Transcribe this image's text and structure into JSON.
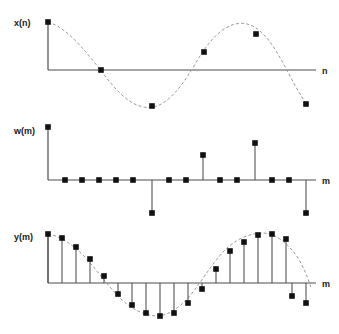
{
  "figure": {
    "title": "",
    "background": "#ffffff",
    "dot_color": "#111111",
    "axis_color": "#4d4d4d",
    "stem_color": "#555555",
    "envelope_color": "#9a9a9a"
  },
  "panels": [
    {
      "id": "panel-xn",
      "ylabel": "x(n)",
      "xlabel": "n",
      "ylabel_pos": {
        "x": 14,
        "y": 22
      },
      "xlabel_pos": {
        "x": 322,
        "y": 74
      },
      "axis": {
        "x0": 48,
        "y0": 70,
        "x1": 316,
        "ytop": 22
      },
      "dots": [
        {
          "x": 48,
          "y": 22
        },
        {
          "x": 101,
          "y": 70
        },
        {
          "x": 152,
          "y": 106
        },
        {
          "x": 204,
          "y": 52
        },
        {
          "x": 256,
          "y": 34
        },
        {
          "x": 306,
          "y": 104
        }
      ],
      "envelope": "M48,22 C62,26 76,40 90,57 C101,70 110,84 122,95 C134,106 146,110 157,106 C170,101 182,86 194,66 C206,45 218,30 232,25 C246,20 258,26 270,42 C282,58 292,82 302,97 C306,103 306,104 306,104"
    },
    {
      "id": "panel-wm",
      "ylabel": "w(m)",
      "xlabel": "m",
      "ylabel_pos": {
        "x": 14,
        "y": 130
      },
      "xlabel_pos": {
        "x": 322,
        "y": 184
      },
      "axis": {
        "x0": 48,
        "y0": 180,
        "x1": 316,
        "ytop": 127
      },
      "baseline_samples": [
        65,
        82,
        99,
        116,
        133,
        152,
        169,
        186,
        203,
        220,
        237,
        255,
        272,
        289,
        306
      ],
      "stems": [
        {
          "x": 48,
          "y": 127,
          "label": "tall-positive-left"
        },
        {
          "x": 152,
          "y": 213,
          "label": "negative-mid-left"
        },
        {
          "x": 203,
          "y": 155,
          "label": "positive-mid-right"
        },
        {
          "x": 255,
          "y": 143,
          "label": "tall-positive-right"
        },
        {
          "x": 306,
          "y": 213,
          "label": "negative-far-right"
        }
      ],
      "zero_dots": [
        65,
        82,
        99,
        116,
        133,
        169,
        186,
        220,
        237,
        272,
        289
      ]
    },
    {
      "id": "panel-ym",
      "ylabel": "y(m)",
      "xlabel": "m",
      "ylabel_pos": {
        "x": 14,
        "y": 236
      },
      "xlabel_pos": {
        "x": 322,
        "y": 287
      },
      "axis": {
        "x0": 48,
        "y0": 283,
        "x1": 316,
        "ytop": 234
      },
      "stems": [
        {
          "x": 48,
          "y": 234
        },
        {
          "x": 62,
          "y": 238
        },
        {
          "x": 76,
          "y": 247
        },
        {
          "x": 90,
          "y": 259
        },
        {
          "x": 104,
          "y": 276
        },
        {
          "x": 118,
          "y": 294
        },
        {
          "x": 132,
          "y": 305
        },
        {
          "x": 146,
          "y": 313
        },
        {
          "x": 160,
          "y": 316
        },
        {
          "x": 174,
          "y": 313
        },
        {
          "x": 188,
          "y": 303
        },
        {
          "x": 202,
          "y": 289
        },
        {
          "x": 216,
          "y": 269
        },
        {
          "x": 230,
          "y": 251
        },
        {
          "x": 244,
          "y": 242
        },
        {
          "x": 258,
          "y": 235
        },
        {
          "x": 272,
          "y": 234
        },
        {
          "x": 286,
          "y": 239
        },
        {
          "x": 300,
          "y": 250
        },
        {
          "x": 310,
          "y": 264
        }
      ],
      "extra_stems": [
        {
          "x": 278,
          "y": 272
        },
        {
          "x": 292,
          "y": 296
        },
        {
          "x": 306,
          "y": 303
        }
      ],
      "envelope": "M48,234 C60,236 72,244 84,256 C96,269 108,286 120,298 C132,310 146,316 158,316 C170,315 182,306 193,292 C205,276 216,258 228,247 C240,237 252,233 264,233 C276,234 288,243 298,258 C304,268 308,278 310,286"
    }
  ]
}
